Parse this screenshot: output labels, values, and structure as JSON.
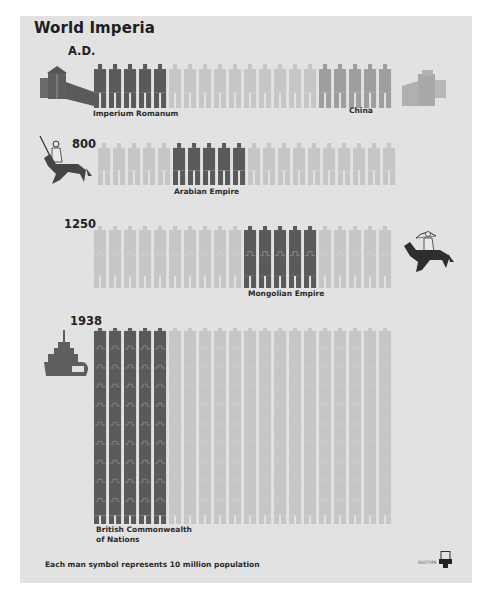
{
  "title": "World Imperia",
  "footer": {
    "note": "Each man symbol represents 10 million population",
    "logo_text": "ISOTYPE",
    "logo_icon": "isotype-logo-icon"
  },
  "colors": {
    "background": "#e2e2e2",
    "highlight": "#5a5a5a",
    "secondary": "#9e9e9e",
    "other": "#c6c6c6"
  },
  "rows": [
    {
      "year": "A.D.",
      "icon": "fortress-wall-icon",
      "labels": [
        "Imperium Romanum",
        "China"
      ]
    },
    {
      "year": "800",
      "icon": "horseman-with-spear-icon",
      "labels": [
        "Arabian Empire"
      ]
    },
    {
      "year": "1250",
      "icon": "mounted-archer-icon",
      "labels": [
        "Mongolian Empire"
      ]
    },
    {
      "year": "1938",
      "icon": "battleship-icon",
      "labels": [
        "British Commonwealth",
        "of Nations"
      ]
    }
  ],
  "chart_data": {
    "type": "pictogram",
    "title": "World Imperia",
    "unit": "Each man symbol represents 10 million population",
    "unit_value_millions": 10,
    "periods": [
      {
        "year": "A.D.",
        "total_symbols": 20,
        "world_population_millions": 200,
        "segments": [
          {
            "name": "Imperium Romanum",
            "symbols": 5,
            "population_millions": 50,
            "shade": "dark"
          },
          {
            "name": "Other",
            "symbols": 10,
            "population_millions": 100,
            "shade": "light"
          },
          {
            "name": "China",
            "symbols": 5,
            "population_millions": 50,
            "shade": "medium"
          }
        ]
      },
      {
        "year": "800",
        "total_symbols": 20,
        "world_population_millions": 200,
        "segments": [
          {
            "name": "Other",
            "symbols": 5,
            "population_millions": 50,
            "shade": "light"
          },
          {
            "name": "Arabian Empire",
            "symbols": 5,
            "population_millions": 50,
            "shade": "dark"
          },
          {
            "name": "Other",
            "symbols": 10,
            "population_millions": 100,
            "shade": "light"
          }
        ]
      },
      {
        "year": "1250",
        "total_symbols": 40,
        "columns": 20,
        "stack_height": 2,
        "world_population_millions": 400,
        "segments": [
          {
            "name": "Other",
            "columns": 10,
            "symbols": 20,
            "population_millions": 200,
            "shade": "light"
          },
          {
            "name": "Mongolian Empire",
            "columns": 5,
            "symbols": 10,
            "population_millions": 100,
            "shade": "dark"
          },
          {
            "name": "Other",
            "columns": 5,
            "symbols": 10,
            "population_millions": 100,
            "shade": "light"
          }
        ]
      },
      {
        "year": "1938",
        "total_symbols": 200,
        "columns": 20,
        "stack_height": 10,
        "world_population_millions": 2000,
        "segments": [
          {
            "name": "British Commonwealth of Nations",
            "columns": 5,
            "symbols": 50,
            "population_millions": 500,
            "shade": "dark"
          },
          {
            "name": "Other",
            "columns": 15,
            "symbols": 150,
            "population_millions": 1500,
            "shade": "light"
          }
        ]
      }
    ]
  }
}
